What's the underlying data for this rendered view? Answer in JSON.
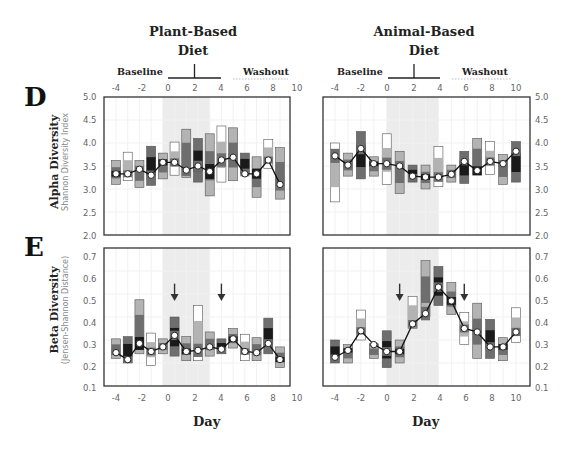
{
  "figure": {
    "columns": [
      {
        "title_line1": "Plant-Based",
        "title_line2": "Diet",
        "baseline_label": "Baseline",
        "washout_label": "Washout"
      },
      {
        "title_line1": "Animal-Based",
        "title_line2": "Diet",
        "baseline_label": "Baseline",
        "washout_label": "Washout"
      }
    ],
    "top_x_ticks": [
      "-4",
      "-2",
      "0",
      "2",
      "4",
      "6",
      "8",
      "10"
    ],
    "bottom_x_ticks": [
      "-4",
      "-2",
      "0",
      "2",
      "4",
      "6",
      "8",
      "10"
    ],
    "x_label": "Day",
    "panel_D": {
      "letter": "D",
      "ylabel": "Alpha Diversity",
      "ylabel_sub": "Shannon Diversity Index",
      "yticks": [
        "5.0",
        "4.5",
        "4.0",
        "3.5",
        "3.0",
        "2.5",
        "2.0"
      ]
    },
    "panel_E": {
      "letter": "E",
      "ylabel": "Beta Diversity",
      "ylabel_sub": "(Jensen-Shannon Distance)",
      "yticks": [
        "0.7",
        "0.6",
        "0.5",
        "0.4",
        "0.3",
        "0.2",
        "0.1"
      ]
    },
    "colors": {
      "light_gray": "#b3b3b3",
      "mid_gray": "#6e6e6e",
      "dark": "#1a1a1a",
      "white_box": "#ffffff",
      "diet_shade": "#ececec",
      "line": "#111111"
    }
  },
  "chart_data": [
    {
      "type": "line",
      "title": "Plant-Based Diet — Alpha Diversity",
      "panel": "D",
      "xlabel": "Day",
      "ylabel": "Alpha Diversity (Shannon Diversity Index)",
      "xlim": [
        -5,
        10.5
      ],
      "ylim": [
        2.0,
        5.0
      ],
      "diet_period": [
        0,
        4
      ],
      "x": [
        -4,
        -3,
        -2,
        -1,
        0,
        1,
        2,
        3,
        4,
        5,
        6,
        7,
        8,
        9,
        10
      ],
      "series": [
        {
          "name": "median",
          "values": [
            3.33,
            3.33,
            3.43,
            3.3,
            3.58,
            3.58,
            3.41,
            3.5,
            3.38,
            3.63,
            3.69,
            3.33,
            3.33,
            3.63,
            3.1
          ]
        }
      ],
      "boxes": [
        [
          3.1,
          3.62
        ],
        [
          3.18,
          3.8
        ],
        [
          3.03,
          3.62
        ],
        [
          3.08,
          3.93
        ],
        [
          3.22,
          3.78
        ],
        [
          3.3,
          4.02
        ],
        [
          3.25,
          4.3
        ],
        [
          3.15,
          4.1
        ],
        [
          2.85,
          4.2
        ],
        [
          3.15,
          4.37
        ],
        [
          3.18,
          4.33
        ],
        [
          3.33,
          3.78
        ],
        [
          2.82,
          3.7
        ],
        [
          3.45,
          4.08
        ],
        [
          2.78,
          3.9
        ]
      ],
      "arrows": []
    },
    {
      "type": "line",
      "title": "Animal-Based Diet — Alpha Diversity",
      "panel": "D",
      "xlabel": "Day",
      "ylabel": "Alpha Diversity (Shannon Diversity Index)",
      "xlim": [
        -5,
        10.5
      ],
      "ylim": [
        2.0,
        5.0
      ],
      "diet_period": [
        0,
        4
      ],
      "x": [
        -4,
        -3,
        -2,
        -1,
        0,
        1,
        2,
        3,
        4,
        5,
        6,
        7,
        8,
        9,
        10
      ],
      "series": [
        {
          "name": "median",
          "values": [
            3.72,
            3.52,
            3.88,
            3.55,
            3.55,
            3.5,
            3.28,
            3.26,
            3.26,
            3.32,
            3.6,
            3.4,
            3.6,
            3.55,
            3.82
          ]
        }
      ],
      "boxes": [
        [
          2.72,
          4.0
        ],
        [
          3.28,
          3.78
        ],
        [
          3.22,
          4.25
        ],
        [
          3.28,
          3.7
        ],
        [
          3.1,
          4.2
        ],
        [
          2.9,
          3.82
        ],
        [
          3.15,
          3.52
        ],
        [
          3.0,
          3.52
        ],
        [
          3.05,
          3.92
        ],
        [
          3.15,
          3.52
        ],
        [
          3.12,
          3.82
        ],
        [
          3.3,
          4.1
        ],
        [
          3.32,
          4.03
        ],
        [
          3.1,
          3.75
        ],
        [
          3.15,
          4.03
        ]
      ],
      "arrows": []
    },
    {
      "type": "line",
      "title": "Plant-Based Diet — Beta Diversity",
      "panel": "E",
      "xlabel": "Day",
      "ylabel": "Beta Diversity (Jensen-Shannon Distance)",
      "xlim": [
        -5,
        10.5
      ],
      "ylim": [
        0.1,
        0.7
      ],
      "diet_period": [
        0,
        4
      ],
      "x": [
        -4,
        -3,
        -2,
        -1,
        0,
        1,
        2,
        3,
        4,
        5,
        6,
        7,
        8,
        9,
        10
      ],
      "series": [
        {
          "name": "median",
          "values": [
            0.245,
            0.215,
            0.285,
            0.25,
            0.27,
            0.32,
            0.25,
            0.255,
            0.27,
            0.26,
            0.305,
            0.25,
            0.245,
            0.285,
            0.215
          ]
        }
      ],
      "boxes": [
        [
          0.22,
          0.305
        ],
        [
          0.2,
          0.315
        ],
        [
          0.24,
          0.475
        ],
        [
          0.19,
          0.33
        ],
        [
          0.24,
          0.305
        ],
        [
          0.23,
          0.4
        ],
        [
          0.21,
          0.315
        ],
        [
          0.21,
          0.45
        ],
        [
          0.23,
          0.335
        ],
        [
          0.24,
          0.305
        ],
        [
          0.265,
          0.35
        ],
        [
          0.21,
          0.325
        ],
        [
          0.21,
          0.31
        ],
        [
          0.24,
          0.395
        ],
        [
          0.18,
          0.27
        ]
      ],
      "arrows": [
        1,
        5
      ]
    },
    {
      "type": "line",
      "title": "Animal-Based Diet — Beta Diversity",
      "panel": "E",
      "xlabel": "Day",
      "ylabel": "Beta Diversity (Jensen-Shannon Distance)",
      "xlim": [
        -5,
        10.5
      ],
      "ylim": [
        0.1,
        0.7
      ],
      "diet_period": [
        0,
        4
      ],
      "x": [
        -4,
        -3,
        -2,
        -1,
        0,
        1,
        2,
        3,
        4,
        5,
        6,
        7,
        8,
        9,
        10
      ],
      "series": [
        {
          "name": "median",
          "values": [
            0.225,
            0.255,
            0.34,
            0.28,
            0.25,
            0.25,
            0.37,
            0.415,
            0.53,
            0.47,
            0.35,
            0.335,
            0.27,
            0.27,
            0.335
          ]
        }
      ],
      "boxes": [
        [
          0.2,
          0.3
        ],
        [
          0.2,
          0.28
        ],
        [
          0.3,
          0.43
        ],
        [
          0.22,
          0.28
        ],
        [
          0.18,
          0.34
        ],
        [
          0.2,
          0.3
        ],
        [
          0.35,
          0.49
        ],
        [
          0.4,
          0.645
        ],
        [
          0.45,
          0.62
        ],
        [
          0.41,
          0.55
        ],
        [
          0.28,
          0.42
        ],
        [
          0.22,
          0.46
        ],
        [
          0.22,
          0.39
        ],
        [
          0.21,
          0.31
        ],
        [
          0.29,
          0.44
        ]
      ],
      "arrows": [
        1,
        6
      ]
    }
  ]
}
